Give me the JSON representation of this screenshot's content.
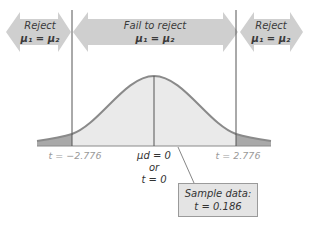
{
  "diagram": {
    "type": "two-tailed t-test rejection region",
    "regions": {
      "left": {
        "line1": "Reject",
        "line2": "μ₁ = μ₂"
      },
      "center": {
        "line1": "Fail to reject",
        "line2": "μ₁ = μ₂"
      },
      "right": {
        "line1": "Reject",
        "line2": "μ₁ = μ₂"
      }
    },
    "axis": {
      "left_critical": "t = −2.776",
      "right_critical": "t = 2.776",
      "center_line1": "μd = 0",
      "center_line2": "or",
      "center_line3": "t = 0"
    },
    "sample_box": {
      "line1": "Sample data:",
      "line2": "t = 0.186"
    },
    "colors": {
      "arrow_fill": "#cfcfcf",
      "curve_fill": "#eaeaea",
      "tail_fill": "#a9a9a9",
      "curve_stroke": "#8a8a8a",
      "line": "#555555"
    }
  }
}
